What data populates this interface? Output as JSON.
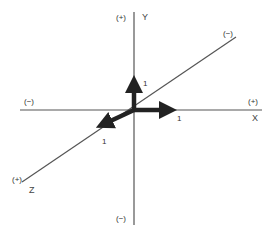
{
  "diagram": {
    "type": "3d-coordinate-axes",
    "colors": {
      "axis_line": "#555555",
      "arrow": "#222222",
      "text": "#333333",
      "background": "#ffffff"
    },
    "axes": {
      "x": {
        "name": "X",
        "positive_label": "(+)",
        "negative_label": "(−)",
        "unit_label": "1"
      },
      "y": {
        "name": "Y",
        "positive_label": "(+)",
        "negative_label": "(−)",
        "unit_label": "1"
      },
      "z": {
        "name": "Z",
        "positive_label": "(+)",
        "negative_label": "(−)",
        "unit_label": "1"
      }
    }
  }
}
